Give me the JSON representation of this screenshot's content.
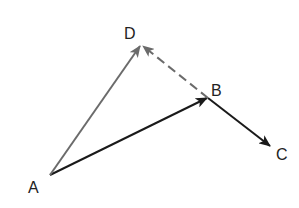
{
  "diagram": {
    "points": {
      "A": {
        "label": "A",
        "x": 50,
        "y": 175
      },
      "B": {
        "label": "B",
        "x": 208,
        "y": 98
      },
      "C": {
        "label": "C",
        "x": 270,
        "y": 146
      },
      "D": {
        "label": "D",
        "x": 141,
        "y": 45
      }
    },
    "vectors": [
      {
        "from": "A",
        "to": "B",
        "style": "solid",
        "color": "#1a1a1a"
      },
      {
        "from": "B",
        "to": "C",
        "style": "solid",
        "color": "#1a1a1a"
      },
      {
        "from": "A",
        "to": "D",
        "style": "solid",
        "color": "#6b6b6b"
      },
      {
        "from": "B",
        "to": "D",
        "style": "dashed",
        "color": "#6b6b6b"
      }
    ]
  }
}
